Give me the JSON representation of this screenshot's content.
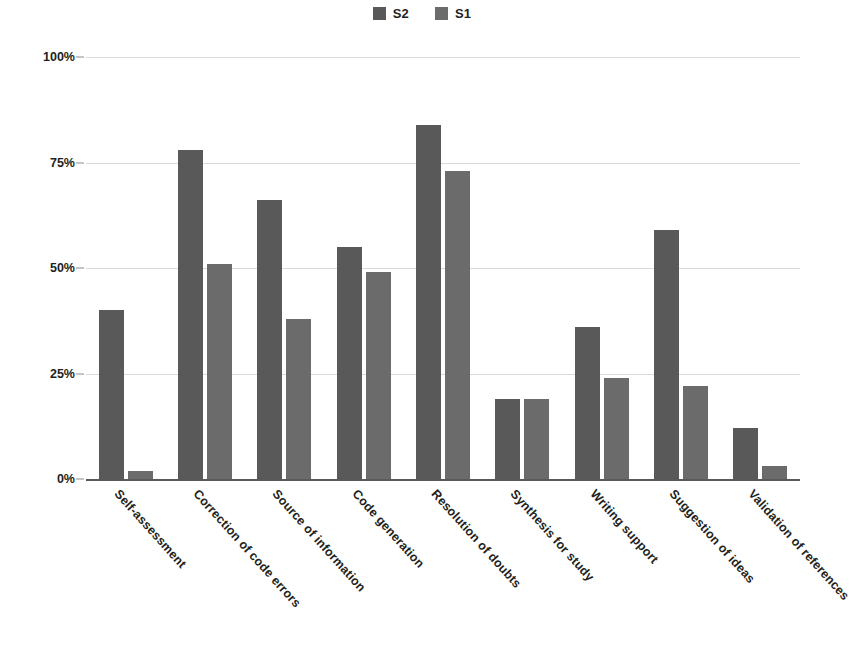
{
  "legend": {
    "position": "top-center",
    "entries": [
      {
        "label": "S2",
        "color": "#595959"
      },
      {
        "label": "S1",
        "color": "#6b6b6b"
      }
    ]
  },
  "axis": {
    "yticks": [
      "0%",
      "25%",
      "50%",
      "75%",
      "100%"
    ]
  },
  "chart_data": {
    "type": "bar",
    "title": "",
    "subtitle": "",
    "xlabel": "",
    "ylabel": "",
    "ylim": [
      0,
      100
    ],
    "ytick_values": [
      0,
      25,
      50,
      75,
      100
    ],
    "ytick_labels": [
      "0%",
      "25%",
      "50%",
      "75%",
      "100%"
    ],
    "grid": true,
    "legend_position": "top-center",
    "orientation": "vertical",
    "grouping": "grouped",
    "categories": [
      "Self-assessment",
      "Correction of code errors",
      "Source of information",
      "Code generation",
      "Resolution of doubts",
      "Synthesis for study",
      "Writing support",
      "Suggestion of ideas",
      "Validation of references"
    ],
    "series": [
      {
        "name": "S2",
        "color": "#595959",
        "values": [
          40,
          78,
          66,
          55,
          84,
          19,
          36,
          59,
          12
        ]
      },
      {
        "name": "S1",
        "color": "#6b6b6b",
        "values": [
          2,
          51,
          38,
          49,
          73,
          19,
          24,
          22,
          3
        ]
      }
    ]
  }
}
